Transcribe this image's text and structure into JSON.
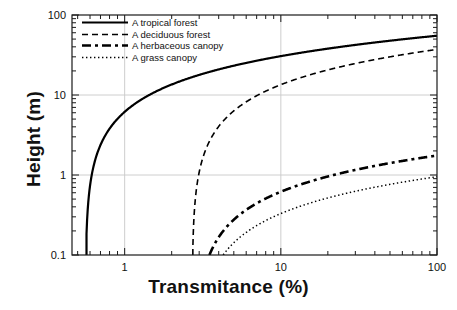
{
  "chart_data": {
    "type": "line",
    "title": "",
    "xlabel": "Transmitance (%)",
    "ylabel": "Height (m)",
    "xscale": "log",
    "yscale": "log",
    "xlim": [
      0.46,
      100
    ],
    "ylim": [
      0.1,
      100
    ],
    "grid": true,
    "xticks": [
      1,
      10,
      100
    ],
    "xtick_labels": [
      "1",
      "10",
      "100"
    ],
    "yticks": [
      0.1,
      1,
      10,
      100
    ],
    "ytick_labels": [
      "0.1",
      "1",
      "10",
      "100"
    ],
    "legend_position": "upper left",
    "series": [
      {
        "name": "A tropical forest",
        "style": "solid",
        "width": 2.2,
        "color": "#000000",
        "model": "H = a * ln(T / T0)",
        "a": 10.62,
        "T0": 0.56,
        "x": [
          0.57,
          0.6,
          0.65,
          0.7,
          0.8,
          0.9,
          1.0,
          1.3,
          1.6,
          2.0,
          2.7,
          3.5,
          5.0,
          7.0,
          10.0,
          15.0,
          20.0,
          30.0,
          50.0,
          70.0,
          100.0
        ],
        "y": [
          0.19,
          0.74,
          1.57,
          2.37,
          3.79,
          5.04,
          6.16,
          8.92,
          11.14,
          13.52,
          16.71,
          19.46,
          23.25,
          26.82,
          30.61,
          35.92,
          39.23,
          43.88,
          49.29,
          52.87,
          55.66
        ]
      },
      {
        "name": "A deciduous forest",
        "style": "dashed",
        "width": 1.6,
        "color": "#000000",
        "model": "H = a * ln(T / T0)",
        "a": 10.28,
        "T0": 2.7,
        "x": [
          2.72,
          2.8,
          3.0,
          3.3,
          3.8,
          4.5,
          5.5,
          7.0,
          9.0,
          12.0,
          16.0,
          22.0,
          30.0,
          42.0,
          60.0,
          80.0,
          100.0
        ],
        "y": [
          0.08,
          0.36,
          1.08,
          2.06,
          3.51,
          5.25,
          7.31,
          9.79,
          12.37,
          15.33,
          18.29,
          21.56,
          24.75,
          28.2,
          31.86,
          34.82,
          37.11
        ]
      },
      {
        "name": "A herbaceous canopy",
        "style": "dashdot",
        "width": 2.6,
        "color": "#000000",
        "model": "H = a * ln(T / T0)",
        "a": 0.492,
        "T0": 2.85,
        "x": [
          2.9,
          3.0,
          3.2,
          3.5,
          4.0,
          4.6,
          5.5,
          6.5,
          8.0,
          10.0,
          13.0,
          17.0,
          22.0,
          30.0,
          42.0,
          60.0,
          80.0,
          100.0
        ],
        "y": [
          0.009,
          0.025,
          0.057,
          0.101,
          0.167,
          0.236,
          0.324,
          0.406,
          0.508,
          0.618,
          0.747,
          0.879,
          1.006,
          1.159,
          1.324,
          1.5,
          1.642,
          1.752
        ]
      },
      {
        "name": "A grass canopy",
        "style": "dotted",
        "width": 1.5,
        "color": "#000000",
        "model": "H = a * ln(T / T0)",
        "a": 0.27,
        "T0": 2.95,
        "x": [
          3.0,
          3.2,
          3.5,
          4.0,
          4.6,
          5.5,
          6.5,
          8.0,
          10.0,
          13.0,
          17.0,
          22.0,
          30.0,
          42.0,
          60.0,
          80.0,
          100.0
        ],
        "y": [
          0.005,
          0.022,
          0.046,
          0.082,
          0.12,
          0.168,
          0.213,
          0.269,
          0.329,
          0.4,
          0.472,
          0.541,
          0.625,
          0.716,
          0.812,
          0.89,
          0.95
        ]
      }
    ]
  },
  "axes": {
    "x_title": "Transmitance (%)",
    "y_title": "Height (m)",
    "x_tick_labels": [
      "1",
      "10",
      "100"
    ],
    "y_tick_labels": [
      "100",
      "10",
      "1",
      "0.1"
    ]
  },
  "legend": {
    "entries": [
      {
        "label": "A tropical forest",
        "style": "solid"
      },
      {
        "label": "A deciduous forest",
        "style": "dashed"
      },
      {
        "label": "A herbaceous canopy",
        "style": "dashdot"
      },
      {
        "label": "A grass canopy",
        "style": "dotted"
      }
    ]
  },
  "colors": {
    "background": "#ffffff",
    "ink": "#000000",
    "grid": "#c8c8c8",
    "frame": "#1a1a1a"
  }
}
